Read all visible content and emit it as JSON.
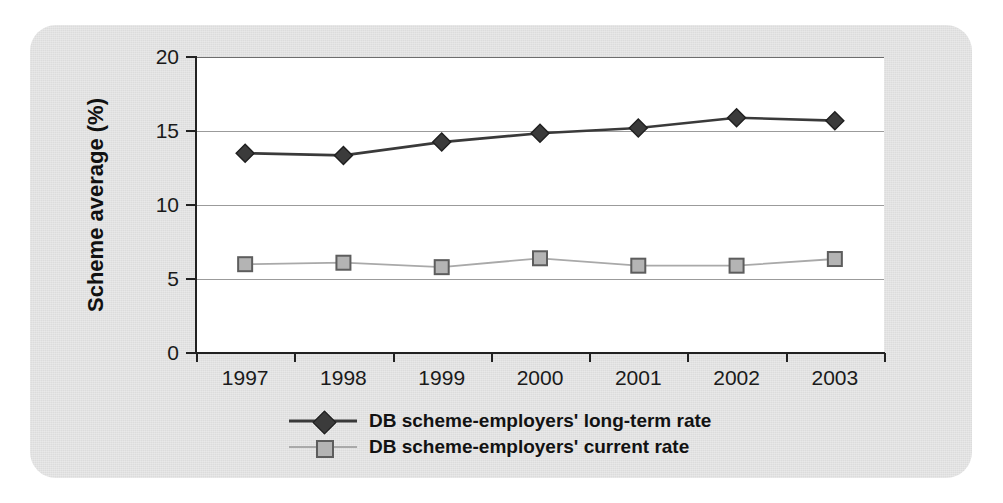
{
  "card": {
    "background_color": "#e2e2e2"
  },
  "chart_data": {
    "type": "line",
    "title": "",
    "xlabel": "",
    "ylabel": "Scheme average (%)",
    "categories": [
      "1997",
      "1998",
      "1999",
      "2000",
      "2001",
      "2002",
      "2003"
    ],
    "x_tick_labels": [
      "1997",
      "1998",
      "1999",
      "2000",
      "2001",
      "2002",
      "2003"
    ],
    "y_tick_labels": [
      "0",
      "5",
      "10",
      "15",
      "20"
    ],
    "y_ticks": [
      0,
      5,
      10,
      15,
      20
    ],
    "ylim": [
      0,
      20
    ],
    "grid": true,
    "grid_axis": "y",
    "legend_position": "bottom-center",
    "series": [
      {
        "name": "DB scheme-employers' long-term rate",
        "marker": "diamond",
        "color": "#3b3b3b",
        "line_color": "#3a3a3a",
        "values": [
          13.5,
          13.35,
          14.25,
          14.85,
          15.2,
          15.9,
          15.7
        ]
      },
      {
        "name": "DB scheme-employers' current rate",
        "marker": "square",
        "color": "#b4b4b4",
        "line_color": "#a9a9a9",
        "values": [
          6.0,
          6.1,
          5.8,
          6.4,
          5.9,
          5.9,
          6.35
        ]
      }
    ]
  },
  "legend": {
    "items": [
      {
        "label": "DB scheme-employers' long-term rate",
        "marker": "diamond-marker"
      },
      {
        "label": "DB scheme-employers' current rate",
        "marker": "square-marker"
      }
    ]
  }
}
